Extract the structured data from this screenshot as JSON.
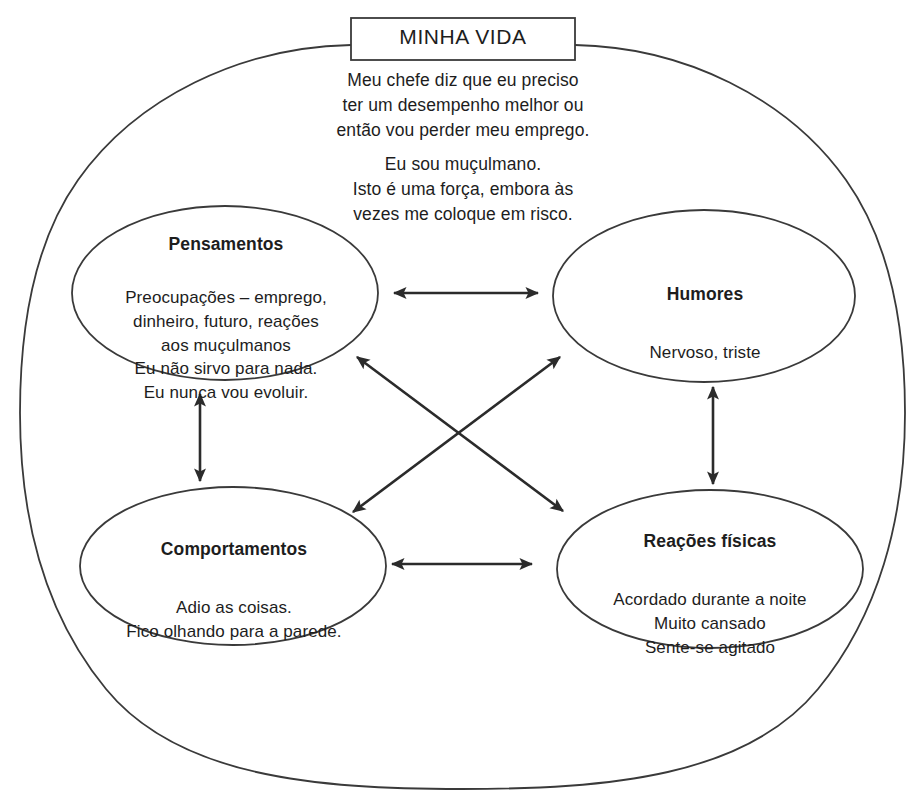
{
  "diagram": {
    "type": "cbt-five-areas-cross-sectional-formulation",
    "language": "pt-BR",
    "title_box": {
      "label": "MINHA VIDA"
    },
    "narrative": {
      "paragraph_1": "Meu chefe diz que eu preciso\nter um desempenho melhor ou\nentão vou perder meu emprego.",
      "paragraph_2": "Eu sou muçulmano.\nIsto é uma força, embora às\nvezes me coloque em risco."
    },
    "nodes": [
      {
        "id": "thoughts",
        "title": "Pensamentos",
        "body": "Preocupações – emprego,\ndinheiro, futuro, reações\naos muçulmanos\nEu não sirvo para nada.\nEu nunca vou evoluir."
      },
      {
        "id": "moods",
        "title": "Humores",
        "body": "Nervoso, triste"
      },
      {
        "id": "behaviours",
        "title": "Comportamentos",
        "body": "Adio as coisas.\nFico olhando para a parede."
      },
      {
        "id": "physical",
        "title": "Reações físicas",
        "body": "Acordado durante a noite\nMuito cansado\nSente-se agitado"
      }
    ],
    "connectors": [
      {
        "id": "thoughts-moods",
        "from": "thoughts",
        "to": "moods",
        "style": "double-headed-arrow",
        "orientation": "horizontal"
      },
      {
        "id": "behaviours-physical",
        "from": "behaviours",
        "to": "physical",
        "style": "double-headed-arrow",
        "orientation": "horizontal"
      },
      {
        "id": "thoughts-behaviours",
        "from": "thoughts",
        "to": "behaviours",
        "style": "double-headed-arrow",
        "orientation": "vertical"
      },
      {
        "id": "moods-physical",
        "from": "moods",
        "to": "physical",
        "style": "double-headed-arrow",
        "orientation": "vertical"
      },
      {
        "id": "thoughts-physical",
        "from": "thoughts",
        "to": "physical",
        "style": "double-headed-arrow",
        "orientation": "diagonal"
      },
      {
        "id": "moods-behaviours",
        "from": "moods",
        "to": "behaviours",
        "style": "double-headed-arrow",
        "orientation": "diagonal"
      }
    ],
    "colors": {
      "stroke": "#3a3a3a",
      "arrow": "#2b2b2b",
      "text": "#1d1d1d",
      "background": "#ffffff"
    }
  }
}
